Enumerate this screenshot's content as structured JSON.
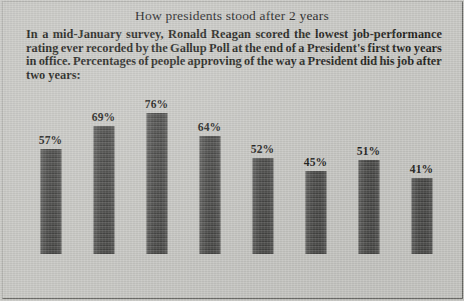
{
  "headline": "How presidents stood after 2 years",
  "deck": {
    "line1_words": [
      "In",
      "a",
      "mid-January",
      "survey,",
      "Ronald",
      "Reagan",
      "scored",
      "the",
      "lowest",
      "job-performance"
    ],
    "line2_words": [
      "rating",
      "ever",
      "recorded",
      "by",
      "the",
      "Gallup",
      "Poll",
      "at",
      "the",
      "end",
      "of",
      "a",
      "President's",
      "first",
      "two",
      "years"
    ],
    "line3_words": [
      "in",
      "office.",
      "Percentages",
      "of",
      "people",
      "approving",
      "of",
      "the",
      "way",
      "a",
      "President",
      "did",
      "his",
      "job",
      "after"
    ],
    "line4": "two years:",
    "full_text": "In a mid-January survey, Ronald Reagan scored the lowest job-performance rating ever recorded by the Gallup Poll at the end of a President's first two years in office. Percentages of people approving of the way a President did his job after two years:"
  },
  "chart_data": {
    "type": "bar",
    "title": "How presidents stood after 2 years",
    "xlabel": "",
    "ylabel": "",
    "ylim": [
      0,
      80
    ],
    "grid": false,
    "legend": null,
    "unit": "%",
    "categories": [
      "Truman",
      "Eisenhower",
      "Kennedy",
      "Johnson",
      "Nixon",
      "Ford",
      "Carter",
      "Reagan"
    ],
    "values": [
      57,
      69,
      76,
      64,
      52,
      45,
      51,
      41
    ],
    "value_labels": [
      "57%",
      "69%",
      "76%",
      "64%",
      "52%",
      "45%",
      "51%",
      "41%"
    ],
    "bar_color": "#4f4f4d",
    "background_color": "#c8c8c4",
    "text_color": "#1c1c1a"
  }
}
